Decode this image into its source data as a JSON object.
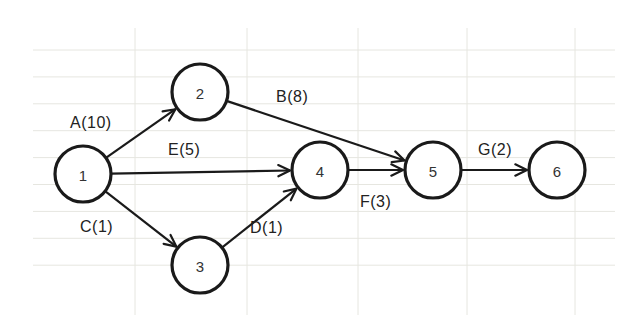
{
  "diagram": {
    "type": "activity-on-arrow network",
    "colors": {
      "stroke": "#1a1a1a",
      "grid": "#e6e6e0",
      "background": "#ffffff"
    },
    "nodes": [
      {
        "id": "1",
        "label": "1",
        "cx": 83,
        "cy": 174
      },
      {
        "id": "2",
        "label": "2",
        "cx": 200,
        "cy": 92
      },
      {
        "id": "3",
        "label": "3",
        "cx": 200,
        "cy": 265
      },
      {
        "id": "4",
        "label": "4",
        "cx": 320,
        "cy": 170
      },
      {
        "id": "5",
        "label": "5",
        "cx": 433,
        "cy": 170
      },
      {
        "id": "6",
        "label": "6",
        "cx": 557,
        "cy": 170
      }
    ],
    "edges": [
      {
        "id": "A",
        "from": "1",
        "to": "2",
        "label": "A(10)",
        "lx": 70,
        "ly": 128
      },
      {
        "id": "B",
        "from": "2",
        "to": "5",
        "label": "B(8)",
        "lx": 276,
        "ly": 102
      },
      {
        "id": "E",
        "from": "1",
        "to": "4",
        "label": "E(5)",
        "lx": 168,
        "ly": 155
      },
      {
        "id": "C",
        "from": "1",
        "to": "3",
        "label": "C(1)",
        "lx": 80,
        "ly": 232
      },
      {
        "id": "D",
        "from": "3",
        "to": "4",
        "label": "D(1)",
        "lx": 250,
        "ly": 233
      },
      {
        "id": "F",
        "from": "4",
        "to": "5",
        "label": "F(3)",
        "lx": 360,
        "ly": 207
      },
      {
        "id": "G",
        "from": "5",
        "to": "6",
        "label": "G(2)",
        "lx": 478,
        "ly": 155
      }
    ]
  }
}
